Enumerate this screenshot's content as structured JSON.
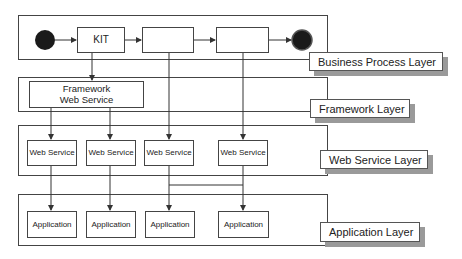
{
  "diagram": {
    "type": "layered-architecture",
    "layers": [
      {
        "id": "business-process",
        "label": "Business Process Layer",
        "nodes": [
          {
            "id": "start",
            "kind": "start-circle",
            "text": ""
          },
          {
            "id": "kit",
            "kind": "box",
            "text": "KIT"
          },
          {
            "id": "bp2",
            "kind": "box",
            "text": ""
          },
          {
            "id": "bp3",
            "kind": "box",
            "text": ""
          },
          {
            "id": "end",
            "kind": "end-circle",
            "text": ""
          }
        ]
      },
      {
        "id": "framework",
        "label": "Framework Layer",
        "nodes": [
          {
            "id": "fws",
            "kind": "box",
            "text_line1": "Framework",
            "text_line2": "Web Service"
          }
        ]
      },
      {
        "id": "web-service",
        "label": "Web Service Layer",
        "nodes": [
          {
            "id": "ws1",
            "text": "Web Service"
          },
          {
            "id": "ws2",
            "text": "Web Service"
          },
          {
            "id": "ws3",
            "text": "Web Service"
          },
          {
            "id": "ws4",
            "text": "Web Service"
          }
        ]
      },
      {
        "id": "application",
        "label": "Application Layer",
        "nodes": [
          {
            "id": "app1",
            "text": "Application"
          },
          {
            "id": "app2",
            "text": "Application"
          },
          {
            "id": "app3",
            "text": "Application"
          },
          {
            "id": "app4",
            "text": "Application"
          }
        ]
      }
    ],
    "edges": [
      [
        "start",
        "kit"
      ],
      [
        "kit",
        "bp2"
      ],
      [
        "bp2",
        "bp3"
      ],
      [
        "bp3",
        "end"
      ],
      [
        "kit",
        "fws"
      ],
      [
        "bp2",
        "ws3"
      ],
      [
        "bp3",
        "ws4"
      ],
      [
        "fws",
        "ws1"
      ],
      [
        "fws",
        "ws2"
      ],
      [
        "ws1",
        "app1"
      ],
      [
        "ws2",
        "app2"
      ],
      [
        "ws3",
        "app3"
      ],
      [
        "ws3",
        "app4"
      ],
      [
        "ws4",
        "app4"
      ]
    ],
    "colors": {
      "stroke": "#444444",
      "circle_fill": "#1a1a1a",
      "label_shadow": "#9a9a9a"
    }
  }
}
